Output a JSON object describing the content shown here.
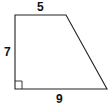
{
  "figure": {
    "shape": "right trapezoid",
    "labels": {
      "top": "5",
      "left": "7",
      "bottom": "9"
    },
    "right_angle_marker": "bottom-left",
    "stroke_color": "#222222",
    "background": "#ffffff"
  }
}
